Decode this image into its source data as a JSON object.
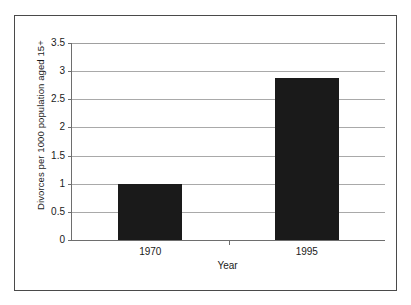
{
  "chart_data": {
    "type": "bar",
    "title": "",
    "categories": [
      "1970",
      "1995"
    ],
    "values": [
      1.0,
      2.88
    ],
    "series": [
      {
        "name": "Divorces per 1000 population aged 15+",
        "values": [
          1.0,
          2.88
        ]
      }
    ],
    "xlabel": "Year",
    "ylabel": "Divorces per 1000 population aged 15+",
    "ylim": [
      0,
      3.5
    ],
    "ytick_labels": [
      "0",
      "0.5",
      "1",
      "1.5",
      "2",
      "2.5",
      "3",
      "3.5"
    ],
    "ytick_values": [
      0,
      0.5,
      1,
      1.5,
      2,
      2.5,
      3,
      3.5
    ],
    "grid": true,
    "legend": false,
    "bar_color": "#1a1a1a",
    "gridline_color": "#a9a9a9",
    "axis_color": "#6e6e6e",
    "frame_color": "#4a4a4a",
    "background_color": "#ffffff"
  }
}
